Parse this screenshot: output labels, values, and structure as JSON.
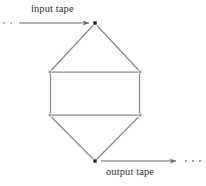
{
  "figure": {
    "type": "block-diagram",
    "background_color": "#ffffff",
    "line_color": "#8a8a8a",
    "node_color": "#262626",
    "text_color": "#2e2e2e",
    "width": 206,
    "height": 186
  },
  "labels": {
    "input_tape": "input tape",
    "output_tape": "output tape"
  },
  "nodes": [
    {
      "id": "top-vertex",
      "x": 95,
      "y": 23,
      "shape": "square",
      "size": 3.4
    },
    {
      "id": "bottom-vertex",
      "x": 95,
      "y": 161,
      "shape": "square",
      "size": 3.4
    }
  ],
  "corners": [
    {
      "id": "upper-left",
      "x": 50,
      "y": 72
    },
    {
      "id": "upper-right",
      "x": 140,
      "y": 72
    },
    {
      "id": "lower-left",
      "x": 50,
      "y": 115
    },
    {
      "id": "lower-right",
      "x": 140,
      "y": 115
    }
  ],
  "edges": [
    {
      "id": "top-left-diagonal",
      "x1": 93,
      "y1": 25,
      "x2": 51,
      "y2": 70
    },
    {
      "id": "top-right-diagonal",
      "x1": 97,
      "y1": 25,
      "x2": 139,
      "y2": 70
    },
    {
      "id": "upper-horizontal",
      "x1": 52,
      "y1": 72,
      "x2": 138,
      "y2": 72
    },
    {
      "id": "left-vertical",
      "x1": 50,
      "y1": 74,
      "x2": 50,
      "y2": 113
    },
    {
      "id": "right-vertical",
      "x1": 140,
      "y1": 74,
      "x2": 140,
      "y2": 113
    },
    {
      "id": "lower-horizontal",
      "x1": 52,
      "y1": 115,
      "x2": 138,
      "y2": 115
    },
    {
      "id": "bottom-left-diagonal",
      "x1": 51,
      "y1": 117,
      "x2": 93,
      "y2": 159
    },
    {
      "id": "bottom-right-diagonal",
      "x1": 139,
      "y1": 117,
      "x2": 97,
      "y2": 159
    }
  ],
  "arrows": {
    "input": {
      "id": "input-tape-arrow",
      "x1": 19,
      "y1": 23,
      "x2": 91,
      "y2": 23,
      "direction": "right"
    },
    "output": {
      "id": "output-tape-arrow",
      "x1": 100,
      "y1": 161,
      "x2": 177,
      "y2": 161,
      "direction": "right"
    }
  },
  "ellipses": {
    "left": {
      "id": "input-tape-ellipsis",
      "cx": [
        3,
        10
      ],
      "cy": 23,
      "count": 2
    },
    "right": {
      "id": "output-tape-ellipsis",
      "cx": [
        185,
        192,
        199
      ],
      "cy": 161,
      "count": 3
    }
  }
}
